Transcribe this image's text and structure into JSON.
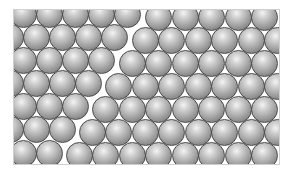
{
  "figure": {
    "title": "",
    "colors": {
      "sphere_highlight": "#f4f4f4",
      "sphere_mid": "#a9a9a9",
      "sphere_shadow": "#6b6b6b",
      "sphere_outline": "#4a4a4a",
      "background": "#ffffff"
    },
    "sphere_diameter": 27,
    "frame": {
      "x": 13,
      "y": 9,
      "width": 267,
      "height": 156
    },
    "grains": [
      {
        "name": "left-grain",
        "rows": [
          {
            "y": 14,
            "x": [
              23,
              49,
              75,
              101,
              127
            ]
          },
          {
            "y": 37,
            "x": [
              10,
              36,
              62,
              88,
              114
            ]
          },
          {
            "y": 60,
            "x": [
              23,
              49,
              75,
              101
            ]
          },
          {
            "y": 83,
            "x": [
              10,
              36,
              62,
              88
            ]
          },
          {
            "y": 106,
            "x": [
              23,
              49,
              75
            ]
          },
          {
            "y": 129,
            "x": [
              10,
              36,
              62
            ]
          },
          {
            "y": 153,
            "x": [
              23,
              49
            ]
          }
        ]
      },
      {
        "name": "right-grain",
        "rows": [
          {
            "y": 17,
            "x": [
              158,
              185,
              211,
              238,
              264
            ]
          },
          {
            "y": 40,
            "x": [
              145,
              171,
              198,
              224,
              251,
              277
            ]
          },
          {
            "y": 63,
            "x": [
              132,
              158,
              185,
              211,
              238,
              264
            ]
          },
          {
            "y": 86,
            "x": [
              118,
              145,
              171,
              198,
              224,
              251,
              277
            ]
          },
          {
            "y": 109,
            "x": [
              105,
              132,
              158,
              185,
              211,
              238,
              264
            ]
          },
          {
            "y": 132,
            "x": [
              92,
              118,
              145,
              171,
              198,
              224,
              251,
              277
            ]
          },
          {
            "y": 155,
            "x": [
              79,
              105,
              132,
              158,
              185,
              211,
              238,
              264
            ]
          }
        ]
      }
    ]
  }
}
